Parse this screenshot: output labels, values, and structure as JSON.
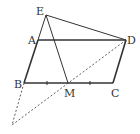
{
  "diagram": {
    "type": "geometry-figure",
    "points": {
      "E": {
        "label": "E",
        "x": 46,
        "y": 15
      },
      "A": {
        "label": "A",
        "x": 38,
        "y": 40
      },
      "D": {
        "label": "D",
        "x": 126,
        "y": 40
      },
      "B": {
        "label": "B",
        "x": 24,
        "y": 83
      },
      "M": {
        "label": "M",
        "x": 68,
        "y": 83
      },
      "C": {
        "label": "C",
        "x": 113,
        "y": 83
      },
      "F": {
        "label": "",
        "x": 12,
        "y": 125
      }
    },
    "solid_segments": [
      "A-D",
      "B-C",
      "A-B",
      "D-C",
      "E-D",
      "E-B",
      "E-M"
    ],
    "dashed_segments": [
      "B-F",
      "D-F"
    ],
    "equal_marks": [
      "B-M",
      "M-C"
    ],
    "stroke_color": "#333333"
  }
}
